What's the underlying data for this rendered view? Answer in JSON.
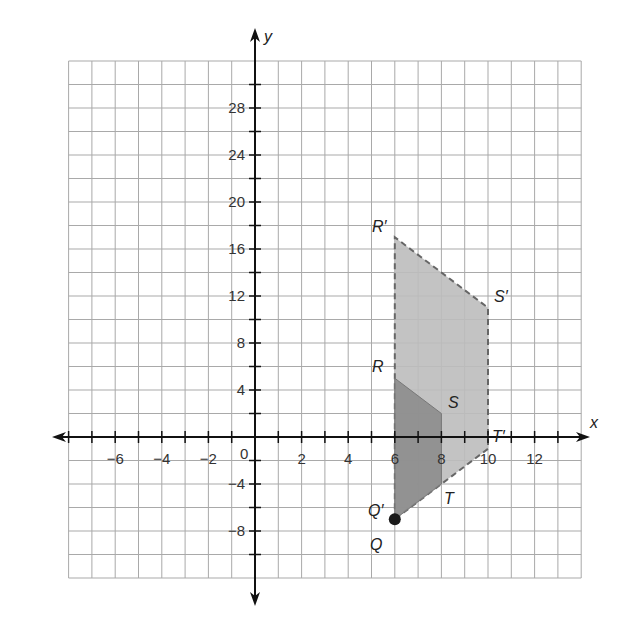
{
  "chart_data": {
    "type": "coordinate-plane",
    "title": "",
    "xlabel": "x",
    "ylabel": "y",
    "x_ticks": [
      -6,
      -4,
      -2,
      2,
      4,
      6,
      8,
      10,
      12
    ],
    "y_ticks": [
      -8,
      -4,
      4,
      8,
      12,
      16,
      20,
      24,
      28
    ],
    "origin_label": "0",
    "xlim": [
      -8,
      14
    ],
    "ylim": [
      -12,
      32
    ],
    "x_unit_per_cell": 1,
    "y_unit_per_cell": 2,
    "grid": true,
    "shapes": [
      {
        "name": "QRST",
        "role": "original",
        "fill": "#8a8a8a",
        "vertices": [
          {
            "label": "Q",
            "x": 6,
            "y": -7
          },
          {
            "label": "R",
            "x": 6,
            "y": 5
          },
          {
            "label": "S",
            "x": 8,
            "y": 2
          },
          {
            "label": "T",
            "x": 8,
            "y": -4
          }
        ]
      },
      {
        "name": "Q'R'S'T'",
        "role": "image (dilation, center Q, scale 2)",
        "fill": "#bdbdbd",
        "stroke": "dashed",
        "vertices": [
          {
            "label": "Q'",
            "x": 6,
            "y": -7
          },
          {
            "label": "R'",
            "x": 6,
            "y": 17
          },
          {
            "label": "S'",
            "x": 10,
            "y": 11
          },
          {
            "label": "T'",
            "x": 10,
            "y": -1
          }
        ]
      }
    ],
    "points": [
      {
        "label": "Q",
        "x": 6,
        "y": -7,
        "marker": "filled-circle"
      }
    ]
  },
  "labels": {
    "x_axis": "x",
    "y_axis": "y",
    "origin": "0",
    "R": "R",
    "S": "S",
    "T": "T",
    "Q": "Q",
    "R_prime": "R′",
    "S_prime": "S′",
    "T_prime": "T′",
    "Q_prime": "Q′"
  }
}
